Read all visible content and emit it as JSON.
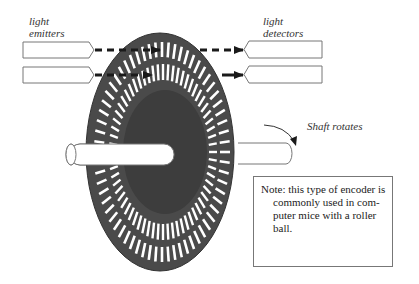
{
  "labels": {
    "emitters": [
      "light",
      "emitters"
    ],
    "detectors": [
      "light",
      "detectors"
    ],
    "shaft": "Shaft rotates"
  },
  "note": {
    "lines": [
      "Note: this type of encoder is",
      "commonly used in com-",
      "puter mice with a roller",
      "ball."
    ]
  },
  "colors": {
    "disc": "#4a4a4a",
    "disc_inner": "#3d3d3d",
    "outline": "#777777",
    "arrow": "#1a1a1a"
  }
}
